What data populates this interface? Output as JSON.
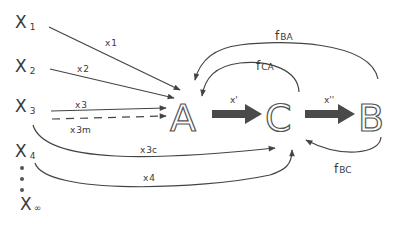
{
  "diagram": {
    "sources": [
      {
        "id": "X1",
        "base": "X",
        "sub": "1"
      },
      {
        "id": "X2",
        "base": "X",
        "sub": "2"
      },
      {
        "id": "X3",
        "base": "X",
        "sub": "3"
      },
      {
        "id": "X4",
        "base": "X",
        "sub": "4"
      },
      {
        "id": "Xinf",
        "base": "X",
        "sub": "∞"
      }
    ],
    "ellipsis": "⋮",
    "nodes": {
      "A": "A",
      "C": "C",
      "B": "B"
    },
    "edges": {
      "x1": {
        "base": "x",
        "sub": "1"
      },
      "x2": {
        "base": "x",
        "sub": "2"
      },
      "x3": {
        "base": "x",
        "sub": "3"
      },
      "x3m": {
        "base": "x",
        "sub": "3m"
      },
      "x3c": {
        "base": "x",
        "sub": "3c"
      },
      "x4": {
        "base": "x",
        "sub": "4"
      },
      "x_prime": "x'",
      "x_double_prime": "x''",
      "fBA": {
        "base": "f",
        "sub": "BA"
      },
      "fCA": {
        "base": "f",
        "sub": "CA"
      },
      "fBC": {
        "base": "f",
        "sub": "BC"
      }
    }
  }
}
